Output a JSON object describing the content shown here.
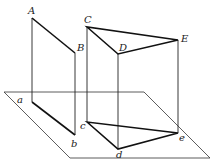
{
  "diagram": {
    "type": "geometry-projection",
    "labels": {
      "A": "A",
      "B": "B",
      "C": "C",
      "D": "D",
      "E": "E",
      "a": "a",
      "b": "b",
      "c": "c",
      "d": "d",
      "e": "e"
    },
    "colors": {
      "stroke": "#1a1a1a",
      "background": "#ffffff"
    }
  }
}
